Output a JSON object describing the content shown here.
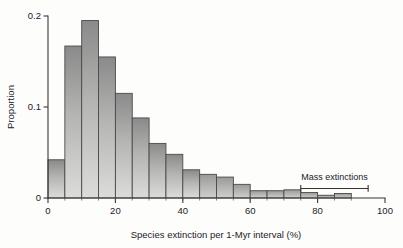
{
  "figure": {
    "background_color": "#fdfdfc",
    "axis_color": "#3a3734",
    "bar_fill_top": "#8e8e8e",
    "bar_fill_bottom": "#d8d8d6",
    "bar_stroke": "#4a4a4a"
  },
  "chart_data": {
    "type": "bar",
    "title": "",
    "subtitle": "",
    "xlabel": "Species extinction per 1-Myr interval (%)",
    "ylabel": "Proportion",
    "xlim": [
      0,
      100
    ],
    "ylim": [
      0,
      0.2
    ],
    "grid": false,
    "legend": null,
    "bin_width": 5,
    "categories": [
      "0-5",
      "5-10",
      "10-15",
      "15-20",
      "20-25",
      "25-30",
      "30-35",
      "35-40",
      "40-45",
      "45-50",
      "50-55",
      "55-60",
      "60-65",
      "65-70",
      "70-75",
      "75-80",
      "80-85",
      "85-90"
    ],
    "bin_starts": [
      0,
      5,
      10,
      15,
      20,
      25,
      30,
      35,
      40,
      45,
      50,
      55,
      60,
      65,
      70,
      75,
      80,
      85
    ],
    "values": [
      0.042,
      0.167,
      0.195,
      0.155,
      0.115,
      0.088,
      0.06,
      0.048,
      0.031,
      0.026,
      0.023,
      0.015,
      0.008,
      0.008,
      0.009,
      0.006,
      0.003,
      0.005
    ],
    "xticks": [
      0,
      20,
      40,
      60,
      80,
      100
    ],
    "xtick_labels": [
      "0",
      "20",
      "40",
      "60",
      "80",
      "100"
    ],
    "yticks": [
      0,
      0.1,
      0.2
    ],
    "ytick_labels": [
      "0",
      "0.1",
      "0.2"
    ],
    "annotations": [
      {
        "name": "mass-extinctions",
        "label": "Mass extinctions",
        "x_start": 75,
        "x_end": 95,
        "y": 0.0105
      }
    ]
  }
}
